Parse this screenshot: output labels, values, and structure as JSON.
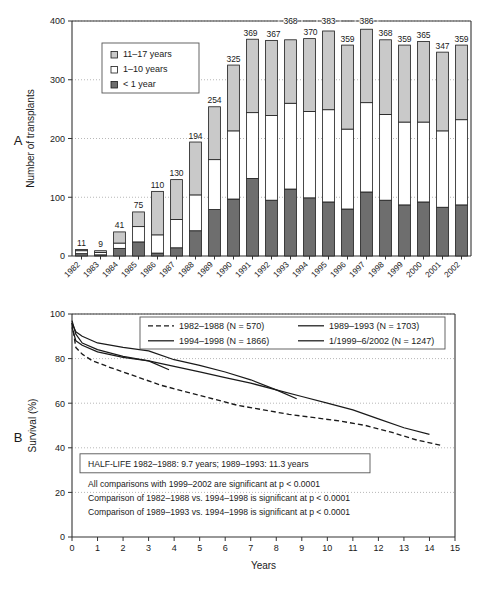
{
  "figure": {
    "panel_a_label": "A",
    "panel_b_label": "B"
  },
  "chart_data": [
    {
      "type": "bar",
      "id": "panel-a",
      "title": "",
      "xlabel": "",
      "ylabel": "Number of transplants",
      "ylim": [
        0,
        400
      ],
      "yticks": [
        0,
        100,
        200,
        300,
        400
      ],
      "grid": true,
      "stacked": true,
      "legend_position": "inside-top-left",
      "categories": [
        "1982",
        "1983",
        "1984",
        "1985",
        "1986",
        "1987",
        "1988",
        "1989",
        "1990",
        "1991",
        "1992",
        "1993",
        "1994",
        "1995",
        "1996",
        "1997",
        "1998",
        "1999",
        "2000",
        "2001",
        "2002"
      ],
      "totals": [
        11,
        9,
        41,
        75,
        110,
        130,
        194,
        254,
        325,
        369,
        367,
        368,
        370,
        383,
        359,
        386,
        368,
        359,
        365,
        347,
        359
      ],
      "series": [
        {
          "name": "< 1 year",
          "color": "#6e6e6e",
          "values": [
            4,
            2,
            13,
            24,
            5,
            14,
            43,
            79,
            97,
            132,
            95,
            114,
            99,
            92,
            80,
            109,
            95,
            87,
            92,
            83,
            87
          ]
        },
        {
          "name": "1–10 years",
          "color": "#ffffff",
          "values": [
            5,
            4,
            9,
            26,
            31,
            48,
            61,
            85,
            116,
            112,
            144,
            146,
            147,
            157,
            136,
            152,
            146,
            141,
            136,
            130,
            145
          ]
        },
        {
          "name": "11–17 years",
          "color": "#c9c9c9",
          "values": [
            2,
            3,
            19,
            25,
            74,
            68,
            90,
            90,
            112,
            125,
            128,
            108,
            124,
            134,
            143,
            125,
            127,
            131,
            137,
            134,
            127
          ]
        }
      ],
      "legend": [
        {
          "label": "11–17 years",
          "swatch": "#c9c9c9"
        },
        {
          "label": "1–10 years",
          "swatch": "#ffffff"
        },
        {
          "label": "< 1 year",
          "swatch": "#6e6e6e"
        }
      ]
    },
    {
      "type": "line",
      "id": "panel-b",
      "title": "",
      "xlabel": "Years",
      "ylabel": "Survival (%)",
      "xlim": [
        0,
        15
      ],
      "ylim": [
        0,
        100
      ],
      "xticks": [
        0,
        1,
        2,
        3,
        4,
        5,
        6,
        7,
        8,
        9,
        10,
        11,
        12,
        13,
        14,
        15
      ],
      "yticks": [
        0,
        20,
        40,
        60,
        80,
        100
      ],
      "grid": true,
      "legend_position": "inside-top",
      "series": [
        {
          "name": "1982–1988 (N = 570)",
          "style": "dashed",
          "x": [
            0,
            0.15,
            0.4,
            0.8,
            1.5,
            2.5,
            3.5,
            4.5,
            5.5,
            6.5,
            7.5,
            8.5,
            9.5,
            10.5,
            11.5,
            12.5,
            13.5,
            14.5
          ],
          "y": [
            96,
            85,
            82,
            79,
            76,
            72,
            68,
            65,
            62,
            59,
            57,
            55,
            53.5,
            52,
            50,
            47,
            43.5,
            41
          ]
        },
        {
          "name": "1989–1993 (N = 1703)",
          "style": "solid",
          "x": [
            0,
            0.15,
            0.4,
            1.0,
            2.0,
            3.0,
            4.0,
            5.0,
            6.0,
            7.0,
            8.0,
            9.0,
            10.0,
            11.0,
            12.0,
            13.0,
            14.0
          ],
          "y": [
            97,
            91,
            87,
            84,
            81,
            79,
            76.5,
            74,
            71.5,
            69,
            66,
            63,
            60,
            57,
            53,
            49,
            46
          ]
        },
        {
          "name": "1994–1998 (N = 1866)",
          "style": "solid",
          "x": [
            0,
            0.15,
            0.4,
            1.0,
            2.0,
            3.0,
            4.0,
            5.0,
            6.0,
            7.0,
            8.0,
            8.8
          ],
          "y": [
            96,
            92,
            90,
            87,
            85,
            83.5,
            79.5,
            77,
            74,
            70.5,
            66,
            62
          ]
        },
        {
          "name": "1/1999–6/2002 (N = 1247)",
          "style": "solid",
          "x": [
            0,
            0.15,
            0.4,
            1.0,
            2.0,
            3.0,
            3.8
          ],
          "y": [
            94,
            88,
            86,
            83,
            80.5,
            79,
            75
          ]
        }
      ],
      "legend": [
        {
          "label": "1982–1988 (N = 570)",
          "style": "dashed"
        },
        {
          "label": "1989–1993 (N = 1703)",
          "style": "solid"
        },
        {
          "label": "1994–1998 (N = 1866)",
          "style": "solid"
        },
        {
          "label": "1/1999–6/2002 (N = 1247)",
          "style": "solid"
        }
      ],
      "annotations": {
        "halflife_box": "HALF-LIFE 1982–1988: 9.7 years; 1989–1993: 11.3 years",
        "notes": [
          "All comparisons with 1999–2002 are significant at p < 0.0001",
          "Comparison of 1982–1988 vs. 1994–1998 is significant at p < 0.0001",
          "Comparison of 1989–1993 vs. 1994–1998 is significant at p < 0.0001"
        ]
      }
    }
  ]
}
